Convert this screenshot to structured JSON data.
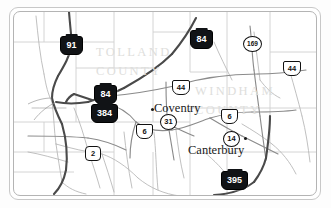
{
  "map": {
    "title": "Tolland and Windham County Road Map",
    "background_color": "#ffffff",
    "frame_color": "#c8c8c8",
    "counties": [
      {
        "id": "tolland",
        "name": "TOLLAND",
        "word": "COUNTY",
        "color": "#dededc"
      },
      {
        "id": "windham",
        "name": "WINDHAM",
        "word": "COUNTY",
        "color": "#dededc"
      }
    ],
    "cities": [
      {
        "id": "coventry",
        "label": "Coventry"
      },
      {
        "id": "canterbury",
        "label": "Canterbury"
      }
    ],
    "route_markers": [
      {
        "id": "i91",
        "number": "91",
        "type": "interstate"
      },
      {
        "id": "i84-north",
        "number": "84",
        "type": "interstate"
      },
      {
        "id": "i84-west",
        "number": "84",
        "type": "interstate"
      },
      {
        "id": "i384",
        "number": "384",
        "type": "interstate"
      },
      {
        "id": "i395",
        "number": "395",
        "type": "interstate"
      },
      {
        "id": "us44-east",
        "number": "44",
        "type": "usroute"
      },
      {
        "id": "us44-center",
        "number": "44",
        "type": "usroute"
      },
      {
        "id": "us6-west",
        "number": "6",
        "type": "usroute"
      },
      {
        "id": "us6-east",
        "number": "6",
        "type": "usroute"
      },
      {
        "id": "ct169",
        "number": "169",
        "type": "state"
      },
      {
        "id": "ct31",
        "number": "31",
        "type": "state"
      },
      {
        "id": "ct14",
        "number": "14",
        "type": "state"
      },
      {
        "id": "ct2",
        "number": "2",
        "type": "staterect"
      }
    ],
    "colors": {
      "highway": "#5a5a5a",
      "major_road": "#7a7a7a",
      "minor_road": "#b0b0b0",
      "county_border": "#c9c9c9",
      "county_label": "#dededc",
      "interstate_shield": "#111316",
      "text": "#1a1a1a"
    }
  }
}
